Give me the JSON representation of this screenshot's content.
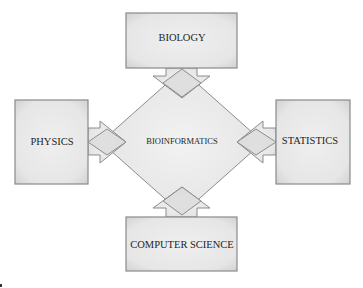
{
  "diagram": {
    "center": {
      "label": "BIOINFORMATICS"
    },
    "nodes": [
      {
        "id": "biology",
        "label": "BIOLOGY",
        "position": "top"
      },
      {
        "id": "physics",
        "label": "PHYSICS",
        "position": "left"
      },
      {
        "id": "statistics",
        "label": "STATISTICS",
        "position": "right"
      },
      {
        "id": "computer-science",
        "label": "COMPUTER SCIENCE",
        "position": "bottom"
      }
    ],
    "edges": [
      {
        "from": "biology",
        "to": "bioinformatics"
      },
      {
        "from": "physics",
        "to": "bioinformatics"
      },
      {
        "from": "statistics",
        "to": "bioinformatics"
      },
      {
        "from": "computer-science",
        "to": "bioinformatics"
      }
    ],
    "colors": {
      "fill": "#e8e8e8",
      "stroke": "#8a8a8a",
      "text": "#1e1e1e"
    }
  }
}
